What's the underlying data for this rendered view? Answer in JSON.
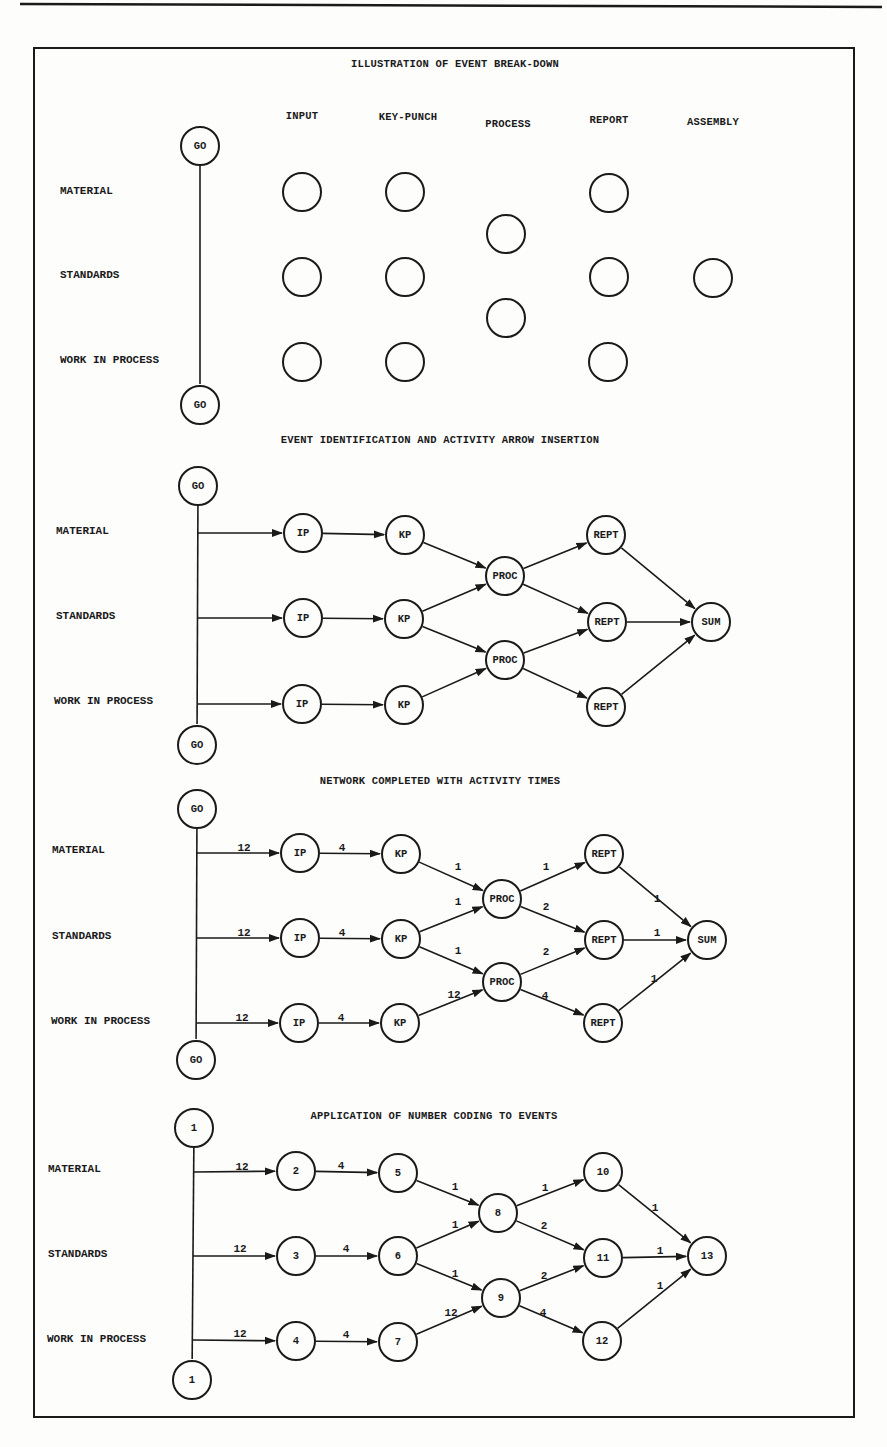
{
  "page": {
    "top_rule": {
      "x1": 20,
      "y1": 4,
      "x2": 882,
      "y2": 7
    },
    "frame": {
      "left": 34,
      "top": 48,
      "right": 854,
      "bottom": 1417
    },
    "colors": {
      "ink": "#1a1a1a",
      "paper": "#fdfdfc"
    }
  },
  "sections": [
    {
      "id": "breakdown",
      "title": "ILLUSTRATION OF EVENT BREAK-DOWN",
      "title_pos": [
        455,
        64
      ],
      "columns": [
        {
          "label": "INPUT",
          "x": 302,
          "y": 116
        },
        {
          "label": "KEY-PUNCH",
          "x": 408,
          "y": 117
        },
        {
          "label": "PROCESS",
          "x": 508,
          "y": 124
        },
        {
          "label": "REPORT",
          "x": 609,
          "y": 120
        },
        {
          "label": "ASSEMBLY",
          "x": 713,
          "y": 122
        }
      ],
      "rows": [
        {
          "label": "MATERIAL",
          "x": 60,
          "y": 191
        },
        {
          "label": "STANDARDS",
          "x": 60,
          "y": 275
        },
        {
          "label": "WORK IN PROCESS",
          "x": 60,
          "y": 360
        }
      ],
      "nodes": [
        {
          "id": "go1",
          "label": "GO",
          "x": 200,
          "y": 146
        },
        {
          "id": "go2",
          "label": "GO",
          "x": 200,
          "y": 405
        },
        {
          "id": "i1",
          "label": "",
          "x": 302,
          "y": 192
        },
        {
          "id": "i2",
          "label": "",
          "x": 302,
          "y": 277
        },
        {
          "id": "i3",
          "label": "",
          "x": 302,
          "y": 362
        },
        {
          "id": "k1",
          "label": "",
          "x": 405,
          "y": 192
        },
        {
          "id": "k2",
          "label": "",
          "x": 405,
          "y": 277
        },
        {
          "id": "k3",
          "label": "",
          "x": 405,
          "y": 362
        },
        {
          "id": "p1",
          "label": "",
          "x": 506,
          "y": 234
        },
        {
          "id": "p2",
          "label": "",
          "x": 506,
          "y": 318
        },
        {
          "id": "r1",
          "label": "",
          "x": 609,
          "y": 193
        },
        {
          "id": "r2",
          "label": "",
          "x": 609,
          "y": 277
        },
        {
          "id": "r3",
          "label": "",
          "x": 608,
          "y": 362
        },
        {
          "id": "a1",
          "label": "",
          "x": 713,
          "y": 278
        }
      ],
      "edges": [
        {
          "from": "go1",
          "to": "go2",
          "arrow": false,
          "time": ""
        }
      ]
    },
    {
      "id": "identification",
      "title": "EVENT IDENTIFICATION AND ACTIVITY ARROW INSERTION",
      "title_pos": [
        440,
        440
      ],
      "columns": [],
      "rows": [
        {
          "label": "MATERIAL",
          "x": 56,
          "y": 531
        },
        {
          "label": "STANDARDS",
          "x": 56,
          "y": 616
        },
        {
          "label": "WORK IN PROCESS",
          "x": 54,
          "y": 701
        }
      ],
      "nodes": [
        {
          "id": "go1",
          "label": "GO",
          "x": 198,
          "y": 486
        },
        {
          "id": "go2",
          "label": "GO",
          "x": 197,
          "y": 745
        },
        {
          "id": "j1",
          "label": "",
          "x": 198,
          "y": 533,
          "junction": true
        },
        {
          "id": "j2",
          "label": "",
          "x": 198,
          "y": 618,
          "junction": true
        },
        {
          "id": "j3",
          "label": "",
          "x": 197,
          "y": 704,
          "junction": true
        },
        {
          "id": "ip1",
          "label": "IP",
          "x": 303,
          "y": 533
        },
        {
          "id": "ip2",
          "label": "IP",
          "x": 303,
          "y": 618
        },
        {
          "id": "ip3",
          "label": "IP",
          "x": 302,
          "y": 704
        },
        {
          "id": "kp1",
          "label": "KP",
          "x": 405,
          "y": 535
        },
        {
          "id": "kp2",
          "label": "KP",
          "x": 404,
          "y": 619
        },
        {
          "id": "kp3",
          "label": "KP",
          "x": 404,
          "y": 705
        },
        {
          "id": "pr1",
          "label": "PROC",
          "x": 505,
          "y": 576
        },
        {
          "id": "pr2",
          "label": "PROC",
          "x": 505,
          "y": 660
        },
        {
          "id": "re1",
          "label": "REPT",
          "x": 606,
          "y": 535
        },
        {
          "id": "re2",
          "label": "REPT",
          "x": 607,
          "y": 622
        },
        {
          "id": "re3",
          "label": "REPT",
          "x": 606,
          "y": 707
        },
        {
          "id": "sum",
          "label": "SUM",
          "x": 711,
          "y": 622
        }
      ],
      "edges": [
        {
          "from": "go1",
          "to": "go2",
          "arrow": false,
          "time": ""
        },
        {
          "from": "j1",
          "to": "ip1",
          "arrow": true,
          "time": ""
        },
        {
          "from": "j2",
          "to": "ip2",
          "arrow": true,
          "time": ""
        },
        {
          "from": "j3",
          "to": "ip3",
          "arrow": true,
          "time": ""
        },
        {
          "from": "ip1",
          "to": "kp1",
          "arrow": true,
          "time": ""
        },
        {
          "from": "ip2",
          "to": "kp2",
          "arrow": true,
          "time": ""
        },
        {
          "from": "ip3",
          "to": "kp3",
          "arrow": true,
          "time": ""
        },
        {
          "from": "kp1",
          "to": "pr1",
          "arrow": true,
          "time": ""
        },
        {
          "from": "kp2",
          "to": "pr1",
          "arrow": true,
          "time": ""
        },
        {
          "from": "kp2",
          "to": "pr2",
          "arrow": true,
          "time": ""
        },
        {
          "from": "kp3",
          "to": "pr2",
          "arrow": true,
          "time": ""
        },
        {
          "from": "pr1",
          "to": "re1",
          "arrow": true,
          "time": ""
        },
        {
          "from": "pr1",
          "to": "re2",
          "arrow": true,
          "time": ""
        },
        {
          "from": "pr2",
          "to": "re2",
          "arrow": true,
          "time": ""
        },
        {
          "from": "pr2",
          "to": "re3",
          "arrow": true,
          "time": ""
        },
        {
          "from": "re1",
          "to": "sum",
          "arrow": true,
          "time": ""
        },
        {
          "from": "re2",
          "to": "sum",
          "arrow": true,
          "time": ""
        },
        {
          "from": "re3",
          "to": "sum",
          "arrow": true,
          "time": ""
        }
      ]
    },
    {
      "id": "times",
      "title": "NETWORK COMPLETED WITH ACTIVITY TIMES",
      "title_pos": [
        440,
        781
      ],
      "columns": [],
      "rows": [
        {
          "label": "MATERIAL",
          "x": 52,
          "y": 850
        },
        {
          "label": "STANDARDS",
          "x": 52,
          "y": 936
        },
        {
          "label": "WORK IN PROCESS",
          "x": 51,
          "y": 1021
        }
      ],
      "nodes": [
        {
          "id": "go1",
          "label": "GO",
          "x": 197,
          "y": 809
        },
        {
          "id": "go2",
          "label": "GO",
          "x": 196,
          "y": 1060
        },
        {
          "id": "j1",
          "label": "",
          "x": 196,
          "y": 853,
          "junction": true
        },
        {
          "id": "j2",
          "label": "",
          "x": 196,
          "y": 938,
          "junction": true
        },
        {
          "id": "j3",
          "label": "",
          "x": 196,
          "y": 1023,
          "junction": true
        },
        {
          "id": "ip1",
          "label": "IP",
          "x": 300,
          "y": 853
        },
        {
          "id": "ip2",
          "label": "IP",
          "x": 300,
          "y": 938
        },
        {
          "id": "ip3",
          "label": "IP",
          "x": 299,
          "y": 1023
        },
        {
          "id": "kp1",
          "label": "KP",
          "x": 401,
          "y": 854
        },
        {
          "id": "kp2",
          "label": "KP",
          "x": 401,
          "y": 939
        },
        {
          "id": "kp3",
          "label": "KP",
          "x": 400,
          "y": 1023
        },
        {
          "id": "pr1",
          "label": "PROC",
          "x": 502,
          "y": 899
        },
        {
          "id": "pr2",
          "label": "PROC",
          "x": 502,
          "y": 982
        },
        {
          "id": "re1",
          "label": "REPT",
          "x": 604,
          "y": 854
        },
        {
          "id": "re2",
          "label": "REPT",
          "x": 604,
          "y": 940
        },
        {
          "id": "re3",
          "label": "REPT",
          "x": 603,
          "y": 1023
        },
        {
          "id": "sum",
          "label": "SUM",
          "x": 707,
          "y": 940
        }
      ],
      "edges": [
        {
          "from": "go1",
          "to": "go2",
          "arrow": false,
          "time": ""
        },
        {
          "from": "j1",
          "to": "ip1",
          "arrow": true,
          "time": "12",
          "tx": 244,
          "ty": 848
        },
        {
          "from": "j2",
          "to": "ip2",
          "arrow": true,
          "time": "12",
          "tx": 244,
          "ty": 933
        },
        {
          "from": "j3",
          "to": "ip3",
          "arrow": true,
          "time": "12",
          "tx": 242,
          "ty": 1018
        },
        {
          "from": "ip1",
          "to": "kp1",
          "arrow": true,
          "time": "4",
          "tx": 342,
          "ty": 848
        },
        {
          "from": "ip2",
          "to": "kp2",
          "arrow": true,
          "time": "4",
          "tx": 342,
          "ty": 933
        },
        {
          "from": "ip3",
          "to": "kp3",
          "arrow": true,
          "time": "4",
          "tx": 341,
          "ty": 1018
        },
        {
          "from": "kp1",
          "to": "pr1",
          "arrow": true,
          "time": "1",
          "tx": 458,
          "ty": 867
        },
        {
          "from": "kp2",
          "to": "pr1",
          "arrow": true,
          "time": "1",
          "tx": 458,
          "ty": 902
        },
        {
          "from": "kp2",
          "to": "pr2",
          "arrow": true,
          "time": "1",
          "tx": 458,
          "ty": 951
        },
        {
          "from": "kp3",
          "to": "pr2",
          "arrow": true,
          "time": "12",
          "tx": 454,
          "ty": 995
        },
        {
          "from": "pr1",
          "to": "re1",
          "arrow": true,
          "time": "1",
          "tx": 546,
          "ty": 867
        },
        {
          "from": "pr1",
          "to": "re2",
          "arrow": true,
          "time": "2",
          "tx": 546,
          "ty": 907
        },
        {
          "from": "pr2",
          "to": "re2",
          "arrow": true,
          "time": "2",
          "tx": 546,
          "ty": 952
        },
        {
          "from": "pr2",
          "to": "re3",
          "arrow": true,
          "time": "4",
          "tx": 545,
          "ty": 996
        },
        {
          "from": "re1",
          "to": "sum",
          "arrow": true,
          "time": "1",
          "tx": 657,
          "ty": 899
        },
        {
          "from": "re2",
          "to": "sum",
          "arrow": true,
          "time": "1",
          "tx": 657,
          "ty": 933
        },
        {
          "from": "re3",
          "to": "sum",
          "arrow": true,
          "time": "1",
          "tx": 654,
          "ty": 979
        }
      ]
    },
    {
      "id": "numbering",
      "title": "APPLICATION OF NUMBER CODING TO EVENTS",
      "title_pos": [
        434,
        1116
      ],
      "columns": [],
      "rows": [
        {
          "label": "MATERIAL",
          "x": 48,
          "y": 1169
        },
        {
          "label": "STANDARDS",
          "x": 48,
          "y": 1254
        },
        {
          "label": "WORK IN PROCESS",
          "x": 47,
          "y": 1339
        }
      ],
      "nodes": [
        {
          "id": "n1a",
          "label": "1",
          "x": 194,
          "y": 1128
        },
        {
          "id": "n1b",
          "label": "1",
          "x": 192,
          "y": 1380
        },
        {
          "id": "j1",
          "label": "",
          "x": 193,
          "y": 1172,
          "junction": true
        },
        {
          "id": "j2",
          "label": "",
          "x": 193,
          "y": 1256,
          "junction": true
        },
        {
          "id": "j3",
          "label": "",
          "x": 193,
          "y": 1340,
          "junction": true
        },
        {
          "id": "n2",
          "label": "2",
          "x": 296,
          "y": 1171
        },
        {
          "id": "n3",
          "label": "3",
          "x": 296,
          "y": 1256
        },
        {
          "id": "n4",
          "label": "4",
          "x": 296,
          "y": 1341
        },
        {
          "id": "n5",
          "label": "5",
          "x": 398,
          "y": 1173
        },
        {
          "id": "n6",
          "label": "6",
          "x": 398,
          "y": 1256
        },
        {
          "id": "n7",
          "label": "7",
          "x": 398,
          "y": 1342
        },
        {
          "id": "n8",
          "label": "8",
          "x": 498,
          "y": 1213
        },
        {
          "id": "n9",
          "label": "9",
          "x": 501,
          "y": 1298
        },
        {
          "id": "n10",
          "label": "10",
          "x": 603,
          "y": 1172
        },
        {
          "id": "n11",
          "label": "11",
          "x": 603,
          "y": 1258
        },
        {
          "id": "n12",
          "label": "12",
          "x": 602,
          "y": 1341
        },
        {
          "id": "n13",
          "label": "13",
          "x": 707,
          "y": 1256
        }
      ],
      "edges": [
        {
          "from": "n1a",
          "to": "n1b",
          "arrow": false,
          "time": ""
        },
        {
          "from": "j1",
          "to": "n2",
          "arrow": true,
          "time": "12",
          "tx": 242,
          "ty": 1167
        },
        {
          "from": "j2",
          "to": "n3",
          "arrow": true,
          "time": "12",
          "tx": 240,
          "ty": 1249
        },
        {
          "from": "j3",
          "to": "n4",
          "arrow": true,
          "time": "12",
          "tx": 240,
          "ty": 1334
        },
        {
          "from": "n2",
          "to": "n5",
          "arrow": true,
          "time": "4",
          "tx": 341,
          "ty": 1166
        },
        {
          "from": "n3",
          "to": "n6",
          "arrow": true,
          "time": "4",
          "tx": 346,
          "ty": 1249
        },
        {
          "from": "n4",
          "to": "n7",
          "arrow": true,
          "time": "4",
          "tx": 346,
          "ty": 1335
        },
        {
          "from": "n5",
          "to": "n8",
          "arrow": true,
          "time": "1",
          "tx": 455,
          "ty": 1187
        },
        {
          "from": "n6",
          "to": "n8",
          "arrow": true,
          "time": "1",
          "tx": 455,
          "ty": 1225
        },
        {
          "from": "n6",
          "to": "n9",
          "arrow": true,
          "time": "1",
          "tx": 455,
          "ty": 1274
        },
        {
          "from": "n7",
          "to": "n9",
          "arrow": true,
          "time": "12",
          "tx": 451,
          "ty": 1313
        },
        {
          "from": "n8",
          "to": "n10",
          "arrow": true,
          "time": "1",
          "tx": 545,
          "ty": 1188
        },
        {
          "from": "n8",
          "to": "n11",
          "arrow": true,
          "time": "2",
          "tx": 544,
          "ty": 1226
        },
        {
          "from": "n9",
          "to": "n11",
          "arrow": true,
          "time": "2",
          "tx": 544,
          "ty": 1276
        },
        {
          "from": "n9",
          "to": "n12",
          "arrow": true,
          "time": "4",
          "tx": 543,
          "ty": 1313
        },
        {
          "from": "n10",
          "to": "n13",
          "arrow": true,
          "time": "1",
          "tx": 655,
          "ty": 1208
        },
        {
          "from": "n11",
          "to": "n13",
          "arrow": true,
          "time": "1",
          "tx": 660,
          "ty": 1251
        },
        {
          "from": "n12",
          "to": "n13",
          "arrow": true,
          "time": "1",
          "tx": 660,
          "ty": 1286
        }
      ]
    }
  ]
}
